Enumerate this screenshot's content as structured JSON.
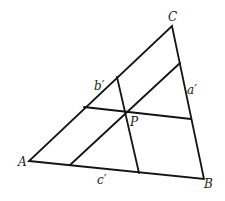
{
  "diagram": {
    "type": "triangle-with-parallel-lines-through-point",
    "vertices": {
      "A": {
        "label": "A",
        "x": 29,
        "y": 161
      },
      "B": {
        "label": "B",
        "x": 204,
        "y": 179
      },
      "C": {
        "label": "C",
        "x": 172,
        "y": 26
      }
    },
    "point": {
      "label": "P",
      "x": 126,
      "y": 112
    },
    "segment_labels": {
      "a_prime": "a′",
      "b_prime": "b′",
      "c_prime": "c′"
    },
    "lines": [
      {
        "name": "parallel-to-AB",
        "from": [
          84,
          107
        ],
        "to": [
          191,
          119
        ]
      },
      {
        "name": "parallel-to-BC",
        "from": [
          117,
          77
        ],
        "to": [
          139,
          173
        ]
      },
      {
        "name": "parallel-to-AC",
        "from": [
          70,
          165
        ],
        "to": [
          180,
          63
        ]
      }
    ],
    "colors": {
      "stroke": "#141414",
      "background": "#ffffff"
    }
  }
}
